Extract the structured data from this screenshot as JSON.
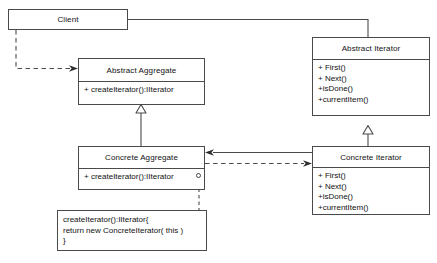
{
  "diagram": {
    "kind": "uml-class-diagram",
    "colors": {
      "background": "#ffffff",
      "line": "#4a4a4a",
      "text": "#111111"
    }
  },
  "classes": {
    "client": {
      "name": "Client",
      "operations": []
    },
    "abstract_aggregate": {
      "name": "Abstract Aggregate",
      "operations": [
        "+ createIterator():IIterator"
      ]
    },
    "concrete_aggregate": {
      "name": "Concrete Aggregate",
      "operations": [
        "+ createIterator():IIterator"
      ]
    },
    "abstract_iterator": {
      "name": "Abstract Iterator",
      "operations": [
        "+ First()",
        "+ Next()",
        "+isDone()",
        "+currentItem()"
      ]
    },
    "concrete_iterator": {
      "name": "Concrete Iterator",
      "operations": [
        "+ First()",
        "+ Next()",
        "+isDone()",
        "+currentItem()"
      ]
    }
  },
  "note": {
    "lines": [
      "createIterator():IIterator{",
      "return new ConcreteIterator( this )",
      "}"
    ]
  },
  "relationships": [
    {
      "name": "client-to-abstract-iterator",
      "style": "solid",
      "arrow": "none",
      "from": "client",
      "to": "abstract_iterator"
    },
    {
      "name": "client-to-abstract-aggregate",
      "style": "dashed",
      "arrow": "open-filled",
      "from": "client",
      "to": "abstract_aggregate"
    },
    {
      "name": "concrete-aggregate-generalization",
      "style": "solid",
      "arrow": "hollow-triangle",
      "from": "concrete_aggregate",
      "to": "abstract_aggregate"
    },
    {
      "name": "concrete-iterator-generalization",
      "style": "solid",
      "arrow": "hollow-triangle",
      "from": "concrete_iterator",
      "to": "abstract_iterator"
    },
    {
      "name": "concrete-iterator-to-concrete-aggregate",
      "style": "solid",
      "arrow": "open-filled",
      "from": "concrete_iterator",
      "to": "concrete_aggregate"
    },
    {
      "name": "concrete-aggregate-to-concrete-iterator",
      "style": "dashed",
      "arrow": "open-filled",
      "from": "concrete_aggregate",
      "to": "concrete_iterator"
    },
    {
      "name": "note-anchor",
      "style": "dashed",
      "arrow": "none",
      "from": "note",
      "to": "concrete_aggregate"
    }
  ]
}
